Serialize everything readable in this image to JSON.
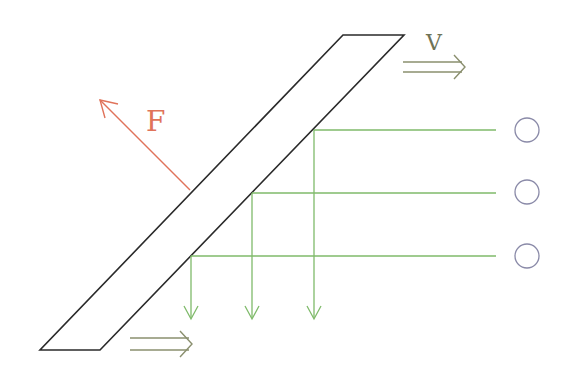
{
  "diagram": {
    "colors": {
      "bar": "#2a2a2a",
      "force": "#e0735a",
      "projection": "#7fba6a",
      "velocity": "#8a8f6e",
      "circle": "#8a8aa8",
      "background": "#ffffff"
    },
    "labels": {
      "force": "F",
      "velocity": "V"
    },
    "bar": {
      "points": [
        [
          343,
          35
        ],
        [
          404,
          35
        ],
        [
          100,
          350
        ],
        [
          40,
          350
        ]
      ]
    },
    "force_arrow": {
      "from": [
        190,
        190
      ],
      "to": [
        100,
        100
      ]
    },
    "force_label_pos": [
      146,
      130
    ],
    "velocity_label_pos": [
      426,
      50
    ],
    "velocity_arrow": {
      "x1": 403,
      "x2": 465,
      "y1": 62,
      "y2": 72
    },
    "bottom_arrow": {
      "x1": 130,
      "x2": 192,
      "y1": 338,
      "y2": 350
    },
    "projections": [
      {
        "y": 130,
        "x_start": 314,
        "x_end": 496,
        "drop_to": 318
      },
      {
        "y": 193,
        "x_start": 252,
        "x_end": 496,
        "drop_to": 318
      },
      {
        "y": 256,
        "x_start": 191,
        "x_end": 496,
        "drop_to": 318
      }
    ],
    "circles": [
      {
        "cx": 527,
        "cy": 130,
        "r": 12
      },
      {
        "cx": 527,
        "cy": 192,
        "r": 12
      },
      {
        "cx": 527,
        "cy": 256,
        "r": 12
      }
    ]
  }
}
